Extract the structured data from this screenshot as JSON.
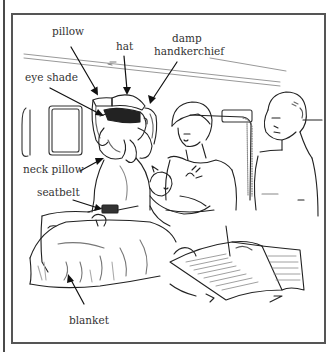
{
  "figure": {
    "labels": {
      "pillow": "pillow",
      "hat": "hat",
      "damp_handkerchief_line1": "damp",
      "damp_handkerchief_line2": "handkerchief",
      "eye_shade": "eye shade",
      "neck_pillow": "neck pillow",
      "seatbelt": "seatbelt",
      "blanket": "blanket"
    },
    "colors": {
      "line": "#222222",
      "frame": "#555555",
      "text": "#333333",
      "background": "#ffffff"
    }
  }
}
